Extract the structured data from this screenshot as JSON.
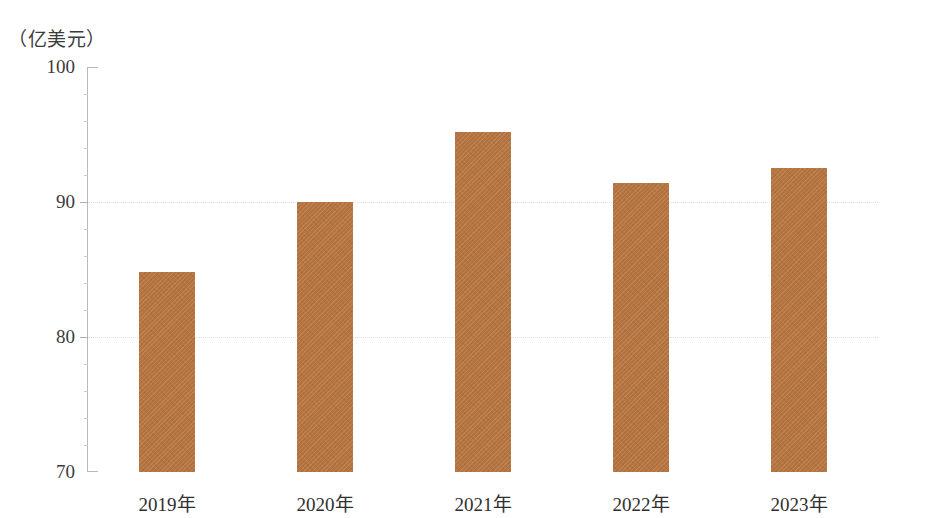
{
  "chart_data": {
    "type": "bar",
    "title": "",
    "subtitle": "",
    "xlabel": "",
    "ylabel": "（亿美元）",
    "unit_label": "（亿美元）",
    "categories": [
      "2019年",
      "2020年",
      "2021年",
      "2022年",
      "2023年"
    ],
    "values": [
      84.8,
      90.0,
      95.2,
      91.4,
      92.5
    ],
    "series": [
      {
        "name": "",
        "values": [
          84.8,
          90.0,
          95.2,
          91.4,
          92.5
        ]
      }
    ],
    "ylim": [
      70,
      100
    ],
    "y_ticks": [
      100,
      90,
      80,
      70
    ],
    "y_tick_labels": [
      "100",
      "90",
      "80",
      "70"
    ],
    "minor_tick_step": 2,
    "grid": true,
    "grid_axis": "y",
    "legend": false,
    "legend_position": "none",
    "bar_color": "#b5743f",
    "axis_color": "#b9b9b9",
    "text_color": "#3c3c3c",
    "annotations": []
  }
}
